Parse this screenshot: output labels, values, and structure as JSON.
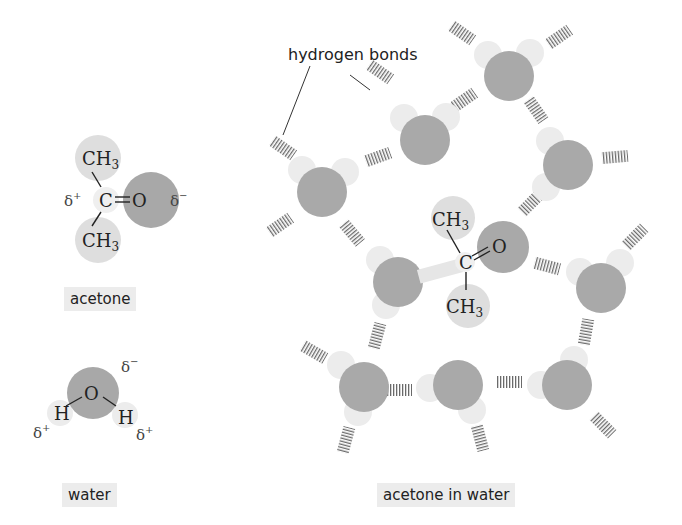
{
  "labels": {
    "acetone": "acetone",
    "water": "water",
    "acetone_in_water": "acetone in water",
    "hydrogen_bonds": "hydrogen bonds"
  },
  "acetone_molecule": {
    "methyl_top": "CH",
    "methyl_bottom": "CH",
    "subscript": "3",
    "carbon": "C",
    "oxygen": "O",
    "delta_plus": "δ+",
    "delta_minus": "δ−"
  },
  "water_molecule": {
    "oxygen": "O",
    "hydrogen_left": "H",
    "hydrogen_right": "H",
    "delta_minus": "δ−",
    "delta_plus_left": "δ+",
    "delta_plus_right": "δ+"
  },
  "colors": {
    "oxygen": "#a9a9a9",
    "hydrogen": "#e8e8e8",
    "methyl": "#dcdcdc",
    "hbond": "#666666",
    "label_bg": "#ececec",
    "text": "#222222"
  }
}
